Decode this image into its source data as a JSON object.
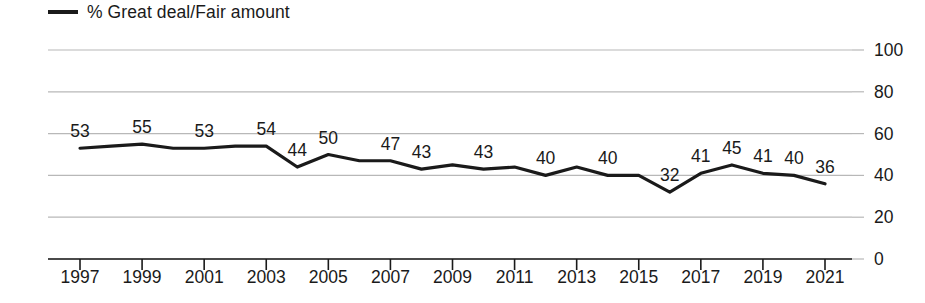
{
  "legend": {
    "series_label": "% Great deal/Fair amount",
    "marker": "line-swatch-icon",
    "position": "top-left"
  },
  "axis": {
    "y_ticks": [
      "0",
      "20",
      "40",
      "60",
      "80",
      "100"
    ],
    "x_ticks": [
      "1997",
      "1999",
      "2001",
      "2003",
      "2005",
      "2007",
      "2009",
      "2011",
      "2013",
      "2015",
      "2017",
      "2019",
      "2021"
    ]
  },
  "colors": {
    "line": "#1a1a1a",
    "gridline": "#b8b8b8",
    "axis": "#1a1a1a",
    "text": "#1a1a1a",
    "background": "#ffffff"
  },
  "chart_data": {
    "type": "line",
    "title": "",
    "subtitle": "",
    "xlabel": "",
    "ylabel": "",
    "ylim": [
      0,
      100
    ],
    "xlim": [
      1997,
      2021
    ],
    "grid": true,
    "legend_position": "top-left",
    "x": [
      1997,
      1998,
      1999,
      2000,
      2001,
      2002,
      2003,
      2004,
      2005,
      2006,
      2007,
      2008,
      2009,
      2010,
      2011,
      2012,
      2013,
      2014,
      2015,
      2016,
      2017,
      2018,
      2019,
      2020,
      2021
    ],
    "series": [
      {
        "name": "% Great deal/Fair amount",
        "values": [
          53,
          54,
          55,
          53,
          53,
          54,
          54,
          44,
          50,
          47,
          47,
          43,
          45,
          43,
          44,
          40,
          44,
          40,
          40,
          32,
          41,
          45,
          41,
          40,
          36
        ]
      }
    ],
    "point_labels": [
      {
        "year": 1997,
        "value": 53,
        "text": "53"
      },
      {
        "year": 1999,
        "value": 55,
        "text": "55"
      },
      {
        "year": 2001,
        "value": 53,
        "text": "53"
      },
      {
        "year": 2003,
        "value": 54,
        "text": "54"
      },
      {
        "year": 2004,
        "value": 44,
        "text": "44"
      },
      {
        "year": 2005,
        "value": 50,
        "text": "50"
      },
      {
        "year": 2007,
        "value": 47,
        "text": "47"
      },
      {
        "year": 2008,
        "value": 43,
        "text": "43"
      },
      {
        "year": 2010,
        "value": 43,
        "text": "43"
      },
      {
        "year": 2012,
        "value": 40,
        "text": "40"
      },
      {
        "year": 2014,
        "value": 40,
        "text": "40"
      },
      {
        "year": 2016,
        "value": 32,
        "text": "32"
      },
      {
        "year": 2017,
        "value": 41,
        "text": "41"
      },
      {
        "year": 2018,
        "value": 45,
        "text": "45"
      },
      {
        "year": 2019,
        "value": 41,
        "text": "41"
      },
      {
        "year": 2020,
        "value": 40,
        "text": "40"
      },
      {
        "year": 2021,
        "value": 36,
        "text": "36"
      }
    ]
  }
}
